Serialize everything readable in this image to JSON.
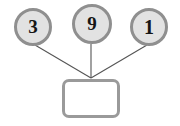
{
  "diagram": {
    "type": "number-bond",
    "title": "",
    "parts": [
      {
        "id": "part-1",
        "label": "3",
        "icon": "circle-node"
      },
      {
        "id": "part-2",
        "label": "9",
        "icon": "circle-node"
      },
      {
        "id": "part-3",
        "label": "1",
        "icon": "circle-node"
      }
    ],
    "total": {
      "id": "sum-box",
      "label": "",
      "placeholder": "",
      "icon": "rounded-rect-node"
    },
    "connectors": [
      {
        "from": "part-1",
        "to": "sum-box"
      },
      {
        "from": "part-2",
        "to": "sum-box"
      },
      {
        "from": "part-3",
        "to": "sum-box"
      }
    ],
    "colors": {
      "circle_fill": "#e2e2e2",
      "circle_border": "#8f8f8f",
      "box_fill": "#ffffff",
      "box_border": "#9a9a9a",
      "line": "#555555",
      "text": "#161616",
      "background": "#ffffff"
    }
  }
}
